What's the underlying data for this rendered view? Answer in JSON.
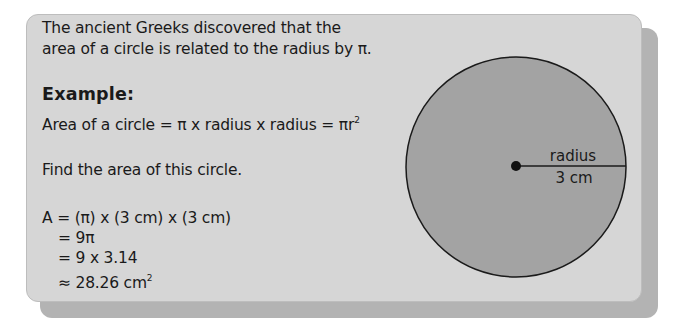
{
  "intro": {
    "lines": [
      "The ancient Greeks discovered that the",
      "area of a circle is related to the radius by π."
    ]
  },
  "example": {
    "heading": "Example:",
    "formula_prefix": "Area of a circle = π x radius x radius = πr",
    "formula_exponent": "2"
  },
  "task": {
    "prompt": "Find the area of this circle."
  },
  "calculation": {
    "line1": "A = (π) x (3 cm) x (3 cm)",
    "line2": "= 9π",
    "line3": "= 9 x 3.14",
    "line4_prefix": "≈ 28.26 cm",
    "line4_exponent": "2"
  },
  "diagram": {
    "radius_label": "radius",
    "radius_value": "3 cm",
    "colors": {
      "card": "#d6d6d6",
      "card_shadow": "#b3b3b3",
      "circle_fill": "#a3a3a3",
      "outline": "#1a1a1a"
    }
  }
}
